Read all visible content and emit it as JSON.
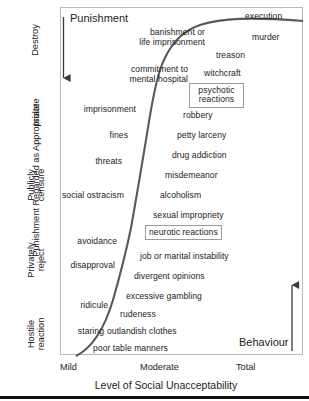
{
  "chart_data": {
    "type": "scatter",
    "title": "",
    "xlabel": "Level of Social Unacceptability",
    "ylabel": "Punishment Regarded as Appropriate",
    "xticklabels": [
      "Mild",
      "Moderate",
      "Total"
    ],
    "yticklabels": [
      "Hostile reaction",
      "Privately reject",
      "Publicly censure",
      "Isolate",
      "Destroy"
    ],
    "grid": false,
    "legend": null,
    "annotations": [
      {
        "text": "Punishment",
        "role": "axis-direction-heading",
        "side": "left-top"
      },
      {
        "text": "Behaviour",
        "role": "axis-direction-heading",
        "side": "right-bottom"
      },
      {
        "text": "execution",
        "role": "extreme-point",
        "position": "top-right"
      }
    ],
    "series": [
      {
        "name": "punishment-severity-curve",
        "type": "line",
        "description": "Sigmoid curve rising from mild/low punishment at lower-left to total/destroy at upper-right"
      },
      {
        "name": "punishment-side-labels",
        "description": "Labels to the left of the curve, ordered top to bottom",
        "values": [
          "banishment or life imprisonment",
          "commitment to mental hospital",
          "imprisonment",
          "fines",
          "threats",
          "social ostracism",
          "avoidance",
          "disapproval",
          "ridicule",
          "staring"
        ]
      },
      {
        "name": "behaviour-side-labels",
        "description": "Labels to the right of the curve, ordered top to bottom",
        "values": [
          "execution",
          "murder",
          "treason",
          "witchcraft",
          "psychotic reactions",
          "robbery",
          "petty larceny",
          "drug addiction",
          "misdemeanor",
          "alcoholism",
          "sexual impropriety",
          "neurotic reactions",
          "job or marital instability",
          "divergent opinions",
          "excessive gambling",
          "rudeness",
          "outlandish clothes",
          "poor table manners"
        ]
      }
    ]
  },
  "figure": {
    "heading_punishment": "Punishment",
    "heading_behaviour": "Behaviour"
  },
  "yaxis": {
    "title": "Punishment Regarded as Appropriate",
    "ticks": [
      {
        "label": "Destroy"
      },
      {
        "label": "Isolate"
      },
      {
        "label": "Publicly censure"
      },
      {
        "label": "Privately reject"
      },
      {
        "label": "Hostile reaction"
      }
    ]
  },
  "xaxis": {
    "title": "Level of Social Unacceptability",
    "ticks": [
      {
        "label": "Mild"
      },
      {
        "label": "Moderate"
      },
      {
        "label": "Total"
      }
    ]
  },
  "labels": {
    "execution": "execution",
    "banishment_1": "banishment or",
    "banishment_2": "life imprisonment",
    "murder": "murder",
    "treason": "treason",
    "commitment_1": "commitment to",
    "commitment_2": "mental hospital",
    "witchcraft": "witchcraft",
    "psychotic_1": "psychotic",
    "psychotic_2": "reactions",
    "imprisonment": "imprisonment",
    "robbery": "robbery",
    "fines": "fines",
    "petty_larceny": "petty larceny",
    "threats": "threats",
    "drug_addiction": "drug addiction",
    "misdemeanor": "misdemeanor",
    "social_ostracism": "social ostracism",
    "alcoholism": "alcoholism",
    "sexual_impropriety": "sexual impropriety",
    "neurotic_reactions": "neurotic reactions",
    "avoidance": "avoidance",
    "job_marital": "job or marital instability",
    "disapproval": "disapproval",
    "divergent_opinions": "divergent opinions",
    "excessive_gambling": "excessive gambling",
    "ridicule": "ridicule",
    "rudeness": "rudeness",
    "staring": "staring",
    "outlandish_clothes": "outlandish clothes",
    "poor_table_manners": "poor table manners"
  }
}
